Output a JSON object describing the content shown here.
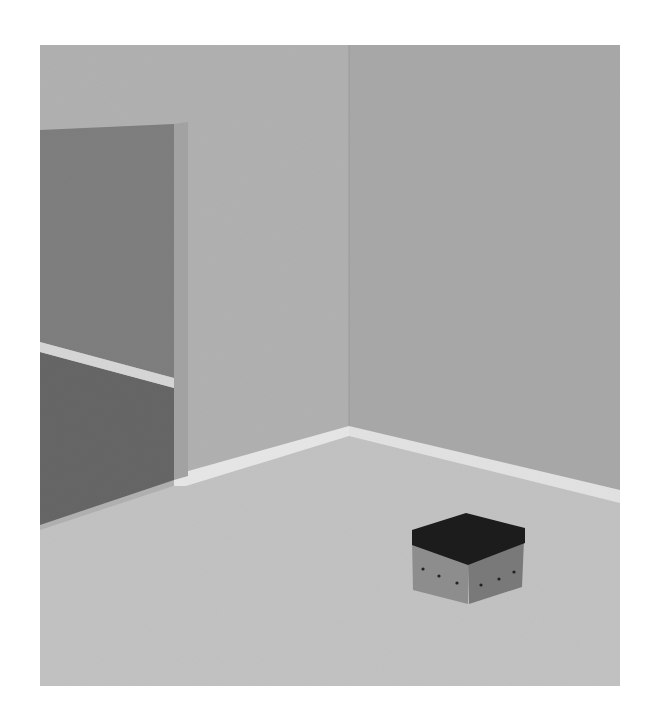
{
  "scene": {
    "description": "Grayscale 3D-rendered empty room corner with an open doorway on the left and a small box with a dark lid on the floor",
    "bounds": {
      "x": 40,
      "y": 45,
      "width": 580,
      "height": 641
    },
    "colors": {
      "background": "#ffffff",
      "left_wall": "#b0b0b0",
      "right_wall": "#a8a8a8",
      "floor": "#c2c2c2",
      "baseboard": "#e6e6e6",
      "door_frame": "#a0a0a0",
      "doorway_upper": "#7e7e7e",
      "doorway_lower": "#666666",
      "doorway_stripe": "#d6d6d6",
      "box_lid": "#1c1c1c",
      "box_left_face": "#8e8e8e",
      "box_right_face": "#7a7a7a",
      "box_holes": "#222222"
    },
    "objects": [
      {
        "name": "left-wall"
      },
      {
        "name": "right-wall"
      },
      {
        "name": "floor"
      },
      {
        "name": "doorway"
      },
      {
        "name": "baseboard"
      },
      {
        "name": "storage-box"
      }
    ]
  }
}
